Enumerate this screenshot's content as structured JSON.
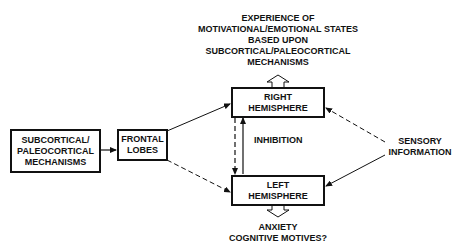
{
  "diagram": {
    "top_label": {
      "lines": [
        "EXPERIENCE OF",
        "MOTIVATIONAL/EMOTIONAL STATES",
        "BASED UPON",
        "SUBCORTICAL/PALEOCORTICAL",
        "MECHANISMS"
      ]
    },
    "nodes": {
      "subcortical": {
        "lines": [
          "SUBCORTICAL/",
          "PALEOCORTICAL",
          "MECHANISMS"
        ]
      },
      "frontal": {
        "lines": [
          "FRONTAL",
          "LOBES"
        ]
      },
      "right_hemisphere": {
        "lines": [
          "RIGHT",
          "HEMISPHERE"
        ]
      },
      "left_hemisphere": {
        "lines": [
          "LEFT",
          "HEMISPHERE"
        ]
      }
    },
    "inhibition_label": "INHIBITION",
    "sensory_label": {
      "lines": [
        "SENSORY",
        "INFORMATION"
      ]
    },
    "bottom_label": {
      "lines": [
        "ANXIETY",
        "COGNITIVE MOTIVES?"
      ]
    },
    "edges": [
      {
        "from": "subcortical",
        "to": "frontal",
        "style": "solid"
      },
      {
        "from": "frontal",
        "to": "right_hemisphere",
        "style": "solid"
      },
      {
        "from": "frontal",
        "to": "left_hemisphere",
        "style": "dashed"
      },
      {
        "from": "right_hemisphere",
        "to": "left_hemisphere",
        "style": "dashed"
      },
      {
        "from": "left_hemisphere",
        "to": "right_hemisphere",
        "style": "solid",
        "label": "INHIBITION"
      },
      {
        "from": "sensory",
        "to": "right_hemisphere",
        "style": "dashed"
      },
      {
        "from": "sensory",
        "to": "left_hemisphere",
        "style": "solid"
      },
      {
        "from": "right_hemisphere",
        "to": "top_label",
        "style": "hollow-arrow"
      },
      {
        "from": "left_hemisphere",
        "to": "bottom_label",
        "style": "hollow-arrow"
      }
    ]
  }
}
